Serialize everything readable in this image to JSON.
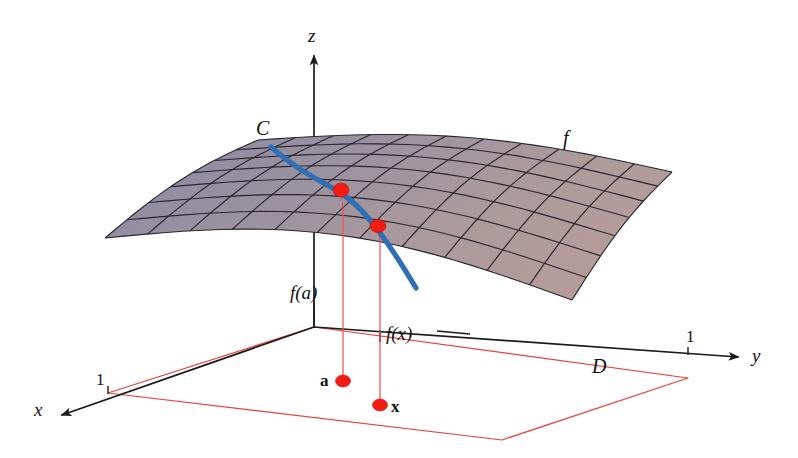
{
  "figure": {
    "background_color": "#ffffff"
  },
  "axes": {
    "z": {
      "label": "z",
      "x": 308,
      "y": 26
    },
    "x": {
      "label": "x",
      "x": 34,
      "y": 400
    },
    "y": {
      "label": "y",
      "x": 752,
      "y": 346
    },
    "origin": {
      "x": 314,
      "y": 327
    }
  },
  "ticks": [
    {
      "name": "x-axis-tick-one",
      "label": "1",
      "x": 96,
      "y": 371
    },
    {
      "name": "y-axis-tick-one",
      "label": "1",
      "x": 686,
      "y": 328
    }
  ],
  "labels": {
    "curve": "C",
    "surface": "f",
    "domain": "D",
    "f_of_a": "f(a)",
    "f_of_x": "f(x)",
    "point_a": "a",
    "point_x": "x"
  },
  "label_positions": {
    "curve": {
      "x": 256,
      "y": 118
    },
    "surface": {
      "x": 563,
      "y": 128
    },
    "domain": {
      "x": 592,
      "y": 356
    },
    "f_of_a": {
      "x": 290,
      "y": 283
    },
    "f_of_x": {
      "x": 386,
      "y": 324
    },
    "point_a": {
      "x": 320,
      "y": 372
    },
    "point_x": {
      "x": 391,
      "y": 398
    }
  },
  "points": [
    {
      "name": "point-a-domain",
      "label": "a",
      "x": 343,
      "y": 381
    },
    {
      "name": "point-x-domain",
      "label": "x",
      "x": 380,
      "y": 405
    },
    {
      "name": "point-f-a-surface",
      "label": "f(a)",
      "x": 341,
      "y": 190
    },
    {
      "name": "point-f-x-surface",
      "label": "f(x)",
      "x": 378,
      "y": 226
    }
  ],
  "colors": {
    "surface_cool": "#8c8aa8",
    "surface_warm": "#b09a9c",
    "curve_blue": "#2f6fb5",
    "domain_red": "#e8413c",
    "point_red": "#f11d13",
    "axis_black": "#1a1a1a",
    "mesh_black": "#2a2530"
  },
  "chart_data": {
    "type": "surface",
    "xlabel": "x",
    "ylabel": "y",
    "zlabel": "z",
    "xlim": [
      0,
      1
    ],
    "ylim": [
      0,
      1
    ],
    "annotations": [
      "C",
      "f",
      "D",
      "f(a)",
      "f(x)",
      "a",
      "x"
    ],
    "grid": true,
    "mesh_rows": 7,
    "mesh_cols": 11
  }
}
